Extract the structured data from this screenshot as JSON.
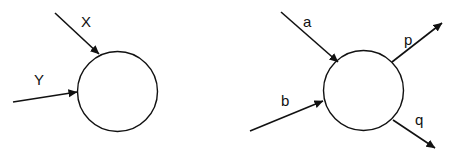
{
  "diagrams": [
    {
      "name": "single-node-inputs",
      "node": {
        "cx": 117.5,
        "cy": 91.5,
        "r": 40
      },
      "edges": [
        {
          "label": "X",
          "direction": "in",
          "x1": 55,
          "y1": 13,
          "x2": 99,
          "y2": 54,
          "lx": 81,
          "ly": 27
        },
        {
          "label": "Y",
          "direction": "in",
          "x1": 13,
          "y1": 102,
          "x2": 77,
          "y2": 92,
          "lx": 34,
          "ly": 85
        }
      ]
    },
    {
      "name": "node-inputs-outputs",
      "node": {
        "cx": 363.5,
        "cy": 90.5,
        "r": 40
      },
      "edges": [
        {
          "label": "a",
          "direction": "in",
          "x1": 281,
          "y1": 12,
          "x2": 338,
          "y2": 62,
          "lx": 303,
          "ly": 27
        },
        {
          "label": "b",
          "direction": "in",
          "x1": 250,
          "y1": 131,
          "x2": 323,
          "y2": 101,
          "lx": 281,
          "ly": 106
        },
        {
          "label": "p",
          "direction": "out",
          "x1": 392,
          "y1": 62,
          "x2": 442,
          "y2": 23,
          "lx": 404,
          "ly": 45
        },
        {
          "label": "q",
          "direction": "out",
          "x1": 393,
          "y1": 120,
          "x2": 435,
          "y2": 148,
          "lx": 415,
          "ly": 125
        }
      ]
    }
  ],
  "style": {
    "stroke": "#111111"
  }
}
